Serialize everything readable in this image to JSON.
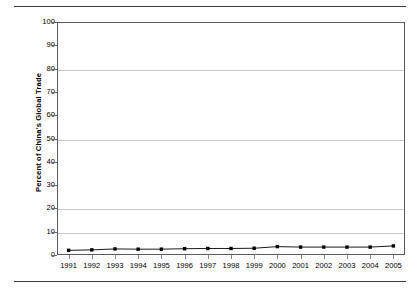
{
  "figure": {
    "has_top_rule": true,
    "has_bottom_rule": true,
    "background_color": "#ffffff",
    "line_color": "#1a1a1a",
    "grid_color": "#c9c9c9",
    "frame_color": "#5a5a5a"
  },
  "chart_data": {
    "type": "line",
    "title": "",
    "subtitle": "",
    "xlabel": "",
    "ylabel": "Percent of China's Global Trade",
    "categories": [
      "1991",
      "1992",
      "1993",
      "1994",
      "1995",
      "1996",
      "1997",
      "1998",
      "1999",
      "2000",
      "2001",
      "2002",
      "2003",
      "2004",
      "2005"
    ],
    "x": [
      1991,
      1992,
      1993,
      1994,
      1995,
      1996,
      1997,
      1998,
      1999,
      2000,
      2001,
      2002,
      2003,
      2004,
      2005
    ],
    "values": [
      2.0,
      2.2,
      2.6,
      2.5,
      2.5,
      2.7,
      2.8,
      2.8,
      2.9,
      3.6,
      3.4,
      3.4,
      3.4,
      3.4,
      3.9
    ],
    "ylim": [
      0,
      100
    ],
    "yticks": [
      0,
      10,
      20,
      30,
      40,
      50,
      60,
      70,
      80,
      90,
      100
    ],
    "ytick_labels": [
      "0",
      "10",
      "20",
      "30",
      "40",
      "50",
      "60",
      "70",
      "80",
      "90",
      "100"
    ],
    "gridlines_y": [
      10,
      20,
      50,
      80
    ],
    "grid": true,
    "legend": false,
    "legend_position": "none",
    "marker": "square",
    "series": [
      {
        "name": "Percent of China's Global Trade",
        "values": [
          2.0,
          2.2,
          2.6,
          2.5,
          2.5,
          2.7,
          2.8,
          2.8,
          2.9,
          3.6,
          3.4,
          3.4,
          3.4,
          3.4,
          3.9
        ]
      }
    ]
  }
}
